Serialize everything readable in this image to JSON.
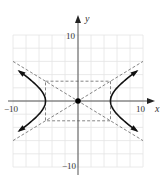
{
  "chart_data": {
    "type": "line",
    "title": "",
    "equation": "x^2/25 - y^2/9 = 1",
    "xlabel": "x",
    "ylabel": "y",
    "xlim": [
      -10,
      10
    ],
    "ylim": [
      -10,
      10
    ],
    "grid": true,
    "grid_step": 2,
    "tick_labels": {
      "x": [
        "-10",
        "10"
      ],
      "y": [
        "10",
        "-10"
      ]
    },
    "center": [
      0,
      0
    ],
    "vertices": [
      [
        -5,
        0
      ],
      [
        5,
        0
      ]
    ],
    "fundamental_rectangle": {
      "x": [
        -5,
        5
      ],
      "y": [
        -3,
        3
      ]
    },
    "asymptotes": [
      "y = 3/5 x",
      "y = -3/5 x"
    ],
    "series": [
      {
        "name": "hyperbola-right-branch",
        "style": "solid",
        "x": [
          10,
          7.5,
          6,
          5,
          6,
          7.5,
          10
        ],
        "y": [
          5.2,
          3.35,
          1.99,
          0,
          -1.99,
          -3.35,
          -5.2
        ]
      },
      {
        "name": "hyperbola-left-branch",
        "style": "solid",
        "x": [
          -10,
          -7.5,
          -6,
          -5,
          -6,
          -7.5,
          -10
        ],
        "y": [
          5.2,
          3.35,
          1.99,
          0,
          -1.99,
          -3.35,
          -5.2
        ]
      },
      {
        "name": "asymptote-positive",
        "style": "dashed",
        "x": [
          -10,
          10
        ],
        "y": [
          -6,
          6
        ]
      },
      {
        "name": "asymptote-negative",
        "style": "dashed",
        "x": [
          -10,
          10
        ],
        "y": [
          6,
          -6
        ]
      }
    ]
  },
  "labels": {
    "x_axis": "x",
    "y_axis": "y",
    "x_min": "−10",
    "x_max": "10",
    "y_max": "10",
    "y_min": "−10"
  }
}
